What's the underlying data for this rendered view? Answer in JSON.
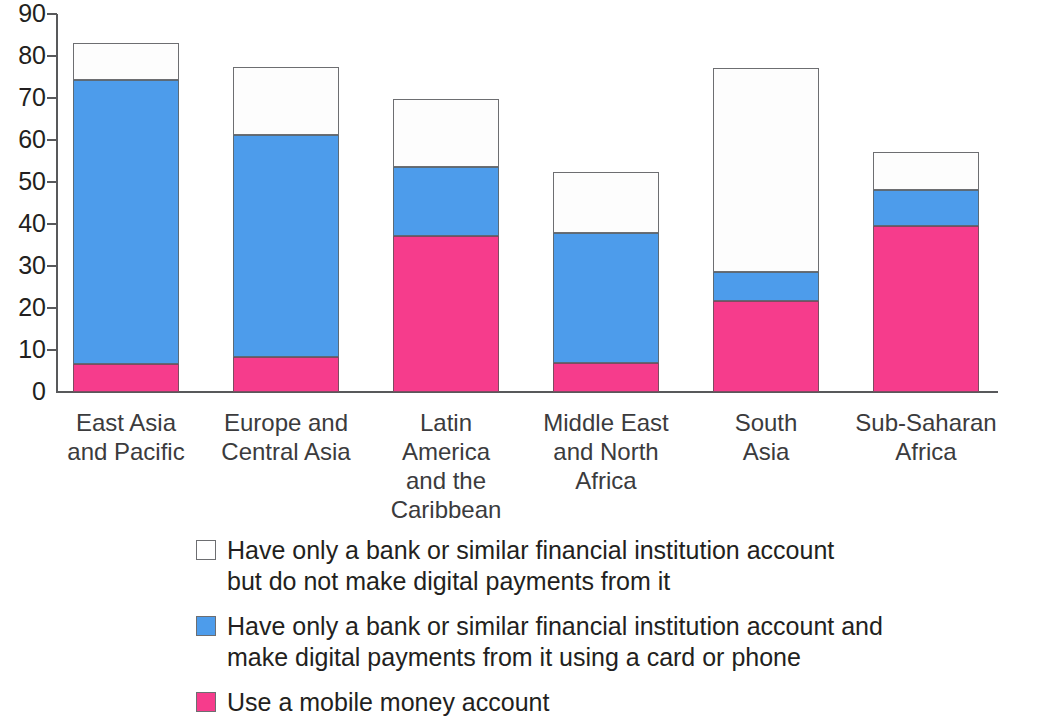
{
  "chart_data": {
    "type": "bar",
    "stacked": true,
    "title": "",
    "subtitle": "",
    "xlabel": "",
    "ylabel": "",
    "ylim": [
      0,
      90
    ],
    "ytick_step": 10,
    "ytick_labels": [
      "90",
      "80",
      "70",
      "60",
      "50",
      "40",
      "30",
      "20",
      "10",
      "0"
    ],
    "grid": false,
    "legend_position": "bottom",
    "categories": [
      "East Asia\nand Pacific",
      "Europe and\nCentral Asia",
      "Latin\nAmerica\nand the\nCaribbean",
      "Middle East\nand North\nAfrica",
      "South\nAsia",
      "Sub-Saharan\nAfrica"
    ],
    "series": [
      {
        "name": "Use a mobile money account",
        "color": "#f63c8c",
        "values": [
          6.6,
          8.3,
          37.1,
          6.9,
          21.7,
          39.6
        ]
      },
      {
        "name": "Have only a bank or similar financial institution account and make digital payments from it using a card or phone",
        "color": "#4d9ceb",
        "values": [
          67.7,
          52.9,
          16.5,
          31.0,
          6.9,
          8.5
        ]
      },
      {
        "name": "Have only a bank or similar financial institution account but do not make digital payments from it",
        "color": "#ffffff",
        "values": [
          8.9,
          16.2,
          16.2,
          14.5,
          48.5,
          9.0
        ]
      }
    ],
    "totals": [
      83.2,
      77.4,
      69.8,
      52.4,
      77.1,
      57.1
    ]
  },
  "legend": {
    "items": [
      {
        "swatch": "white-swatch",
        "label": "Have only a bank or similar financial institution account\nbut do not make digital payments from it"
      },
      {
        "swatch": "blue-swatch",
        "label": "Have only a bank or similar financial institution account and\nmake digital payments from it using a card or phone"
      },
      {
        "swatch": "pink-swatch",
        "label": "Use a mobile money account"
      }
    ]
  },
  "colors": {
    "mobile_money": "#f63c8c",
    "bank_digital": "#4d9ceb",
    "bank_only": "#ffffff",
    "axis": "#58595b",
    "text": "#231f20"
  }
}
